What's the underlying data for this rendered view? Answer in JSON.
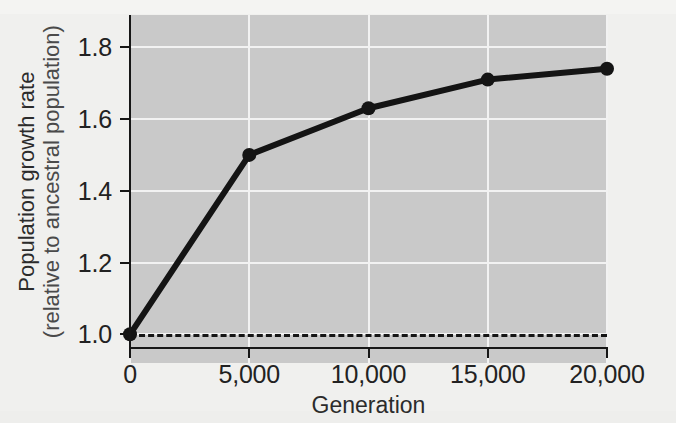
{
  "chart_data": {
    "type": "line",
    "title": "",
    "xlabel": "Generation",
    "ylabel_line1": "Population growth rate",
    "ylabel_line2": "(relative to ancestral population)",
    "x": [
      0,
      5000,
      10000,
      15000,
      20000
    ],
    "series": [
      {
        "name": "Population growth rate",
        "values": [
          1.0,
          1.5,
          1.63,
          1.71,
          1.74
        ],
        "color": "#141414",
        "marker": "circle"
      }
    ],
    "reference_line": {
      "value": 1.0,
      "style": "dashed",
      "color": "#141414"
    },
    "xlim": [
      0,
      20000
    ],
    "ylim": [
      0.92,
      1.89
    ],
    "x_ticks": [
      0,
      5000,
      10000,
      15000,
      20000
    ],
    "x_tick_labels": [
      "0",
      "5,000",
      "10,000",
      "15,000",
      "20,000"
    ],
    "y_ticks": [
      1.0,
      1.2,
      1.4,
      1.6,
      1.8
    ],
    "y_tick_labels": [
      "1.0",
      "1.2",
      "1.4",
      "1.6",
      "1.8"
    ],
    "grid": true,
    "grid_color": "#f2f2f2",
    "plot_background": "#c9c9c9",
    "figure_background": "#f0f0ee",
    "legend": null
  }
}
